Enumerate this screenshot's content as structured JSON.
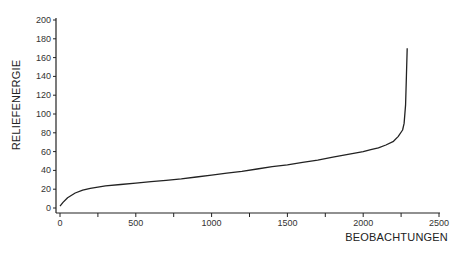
{
  "chart_data": {
    "type": "line",
    "title": "",
    "xlabel": "BEOBACHTUNGEN",
    "ylabel": "RELIEFENERGIE",
    "xlim": [
      0,
      2500
    ],
    "ylim": [
      0,
      200
    ],
    "grid": false,
    "legend": null,
    "x_ticks": [
      0,
      500,
      1000,
      1500,
      2000,
      2500
    ],
    "x_minor_ticks": [
      250,
      750,
      1250,
      1750,
      2250
    ],
    "y_ticks": [
      0,
      20,
      40,
      60,
      80,
      100,
      120,
      140,
      160,
      180,
      200
    ],
    "series": [
      {
        "name": "Reliefenergie (sortiert)",
        "color": "#222222",
        "x": [
          0,
          20,
          50,
          100,
          150,
          200,
          300,
          400,
          500,
          600,
          700,
          800,
          900,
          1000,
          1100,
          1200,
          1300,
          1400,
          1500,
          1600,
          1700,
          1800,
          1900,
          2000,
          2050,
          2100,
          2150,
          2200,
          2230,
          2260,
          2270,
          2280,
          2285,
          2290
        ],
        "values": [
          2,
          6,
          11,
          16,
          19,
          21,
          23.5,
          25,
          26.5,
          28,
          29.5,
          31,
          33,
          35,
          37,
          39,
          41.5,
          44,
          46,
          48.5,
          51,
          54,
          57,
          60,
          62,
          64,
          67,
          71,
          76,
          83,
          90,
          110,
          140,
          170
        ]
      }
    ]
  },
  "axes": {
    "x_title": "BEOBACHTUNGEN",
    "y_title": "RELIEFENERGIE"
  }
}
